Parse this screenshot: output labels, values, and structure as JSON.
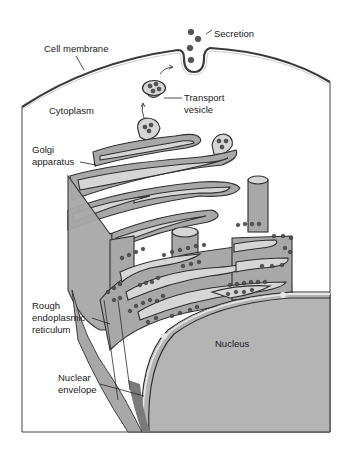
{
  "figure": {
    "type": "labeled biological illustration",
    "colors": {
      "background": "#ffffff",
      "cytoplasm": "#ffffff",
      "organelle_fill": "#a8a8a8",
      "lumen_fill": "#d6d6d6",
      "nucleus_fill": "#b4b4b4",
      "outline": "#2f2f2f",
      "ribosome": "#555555"
    }
  },
  "labels": {
    "secretion": "Secretion",
    "cell_membrane": "Cell membrane",
    "cytoplasm": "Cytoplasm",
    "transport_vesicle_line1": "Transport",
    "transport_vesicle_line2": "vesicle",
    "golgi_line1": "Golgi",
    "golgi_line2": "apparatus",
    "rough_er_line1": "Rough",
    "rough_er_line2": "endoplasmic",
    "rough_er_line3": "reticulum",
    "nucleus": "Nucleus",
    "nuclear_envelope_line1": "Nuclear",
    "nuclear_envelope_line2": "envelope"
  }
}
